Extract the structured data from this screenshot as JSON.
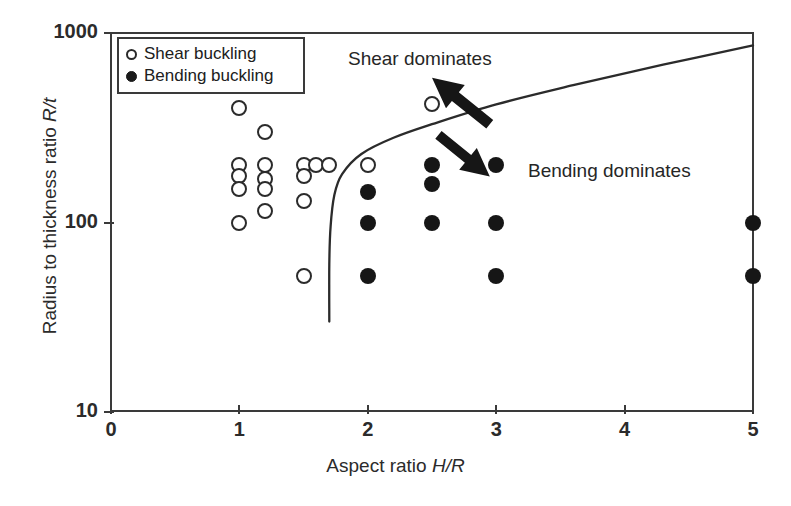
{
  "chart_data": {
    "type": "scatter",
    "title": "",
    "xlabel": "Aspect ratio H/R",
    "ylabel": "Radius to thickness ratio R/t",
    "xlabel_plain": "Aspect ratio",
    "xlabel_italic": "H/R",
    "ylabel_plain": "Radius to thickness ratio",
    "ylabel_italic": "R/t",
    "xscale": "linear",
    "yscale": "log",
    "xlim": [
      0,
      5
    ],
    "ylim": [
      10,
      1000
    ],
    "grid": false,
    "legend_position": "top-left inside",
    "xticks": [
      0,
      1,
      2,
      3,
      4,
      5
    ],
    "xtick_labels": [
      "0",
      "1",
      "2",
      "3",
      "4",
      "5"
    ],
    "yticks": [
      10,
      100,
      1000
    ],
    "ytick_labels": [
      "10",
      "100",
      "1000"
    ],
    "series": [
      {
        "name": "Shear buckling",
        "marker": "open-circle",
        "color": "#2b2b2b",
        "points": [
          [
            1.0,
            400
          ],
          [
            1.0,
            200
          ],
          [
            1.0,
            175
          ],
          [
            1.0,
            150
          ],
          [
            1.0,
            100
          ],
          [
            1.2,
            300
          ],
          [
            1.2,
            200
          ],
          [
            1.2,
            170
          ],
          [
            1.2,
            150
          ],
          [
            1.2,
            115
          ],
          [
            1.5,
            200
          ],
          [
            1.5,
            175
          ],
          [
            1.5,
            130
          ],
          [
            1.5,
            52
          ],
          [
            1.6,
            200
          ],
          [
            1.7,
            200
          ],
          [
            2.0,
            200
          ],
          [
            2.5,
            420
          ]
        ]
      },
      {
        "name": "Bending buckling",
        "marker": "filled-circle",
        "color": "#161616",
        "points": [
          [
            2.0,
            145
          ],
          [
            2.0,
            100
          ],
          [
            2.0,
            52
          ],
          [
            2.5,
            200
          ],
          [
            2.5,
            160
          ],
          [
            2.5,
            100
          ],
          [
            3.0,
            200
          ],
          [
            3.0,
            100
          ],
          [
            3.0,
            52
          ],
          [
            5.0,
            100
          ],
          [
            5.0,
            52
          ]
        ]
      }
    ],
    "boundary_curve": {
      "name": "shear-bending transition",
      "description": "Transition boundary separating shear-dominated (upper-left) from bending-dominated (lower-right) buckling",
      "points": [
        [
          1.7,
          30
        ],
        [
          1.7,
          60
        ],
        [
          1.71,
          95
        ],
        [
          1.74,
          140
        ],
        [
          1.8,
          180
        ],
        [
          1.95,
          230
        ],
        [
          2.2,
          280
        ],
        [
          2.5,
          330
        ],
        [
          3.0,
          420
        ],
        [
          3.6,
          530
        ],
        [
          4.3,
          680
        ],
        [
          5.0,
          860
        ]
      ]
    },
    "annotations": [
      {
        "name": "shear-dominates",
        "text": "Shear dominates",
        "x": 1.85,
        "y": 700
      },
      {
        "name": "bending-dominates",
        "text": "Bending dominates",
        "x": 3.25,
        "y": 230
      }
    ],
    "arrows": [
      {
        "name": "shear-arrow",
        "direction": "up-left",
        "from": [
          2.95,
          330
        ],
        "to": [
          2.5,
          580
        ]
      },
      {
        "name": "bending-arrow",
        "direction": "down-right",
        "from": [
          2.55,
          290
        ],
        "to": [
          2.95,
          175
        ]
      }
    ]
  },
  "legend": {
    "items": [
      {
        "label": "Shear buckling",
        "marker": "open-circle"
      },
      {
        "label": "Bending buckling",
        "marker": "filled-circle"
      }
    ]
  },
  "colors": {
    "axis": "#3a3a3a",
    "text": "#262626",
    "open_marker_stroke": "#2b2b2b",
    "filled_marker": "#161616",
    "background": "#ffffff"
  }
}
